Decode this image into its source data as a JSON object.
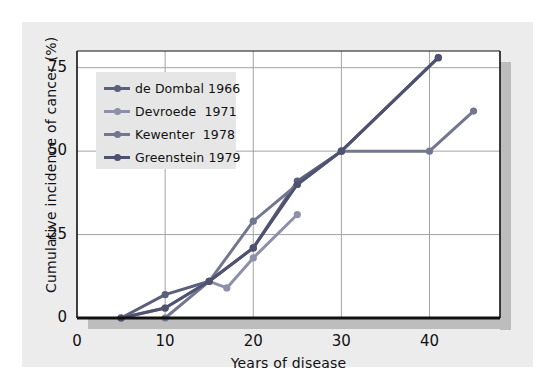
{
  "figure": {
    "background": "#ffffff",
    "panel_color": "#ececed",
    "plot_background": "#ffffff",
    "shadow_color": "#bdbdbd"
  },
  "chart_data": {
    "type": "line",
    "title": "",
    "xlabel": "Years of disease",
    "ylabel": "Cumulative incidence of cancer (%)",
    "xlim": [
      0,
      48
    ],
    "ylim": [
      0,
      80
    ],
    "xticks": [
      0,
      10,
      20,
      30,
      40
    ],
    "xtick_labels": [
      "0",
      "10",
      "20",
      "30",
      "40"
    ],
    "yticks": [
      0,
      25,
      50,
      75
    ],
    "ytick_labels": [
      "0",
      "25",
      "50",
      "75"
    ],
    "grid": true,
    "grid_color": "#9a9a9a",
    "legend_position": "upper left",
    "legend_background": "#e6e6e6",
    "marker": "circle",
    "series": [
      {
        "name": "de Dombal 1966",
        "label": "de Dombal 1966",
        "color": "#5b5f7a",
        "points": [
          {
            "x": 5,
            "y": 0
          },
          {
            "x": 10,
            "y": 7
          },
          {
            "x": 15,
            "y": 11
          },
          {
            "x": 20,
            "y": 21
          },
          {
            "x": 25,
            "y": 41
          },
          {
            "x": 30,
            "y": 50
          },
          {
            "x": 41,
            "y": 78
          }
        ]
      },
      {
        "name": "Devroede 1971",
        "label": "Devroede  1971",
        "color": "#8d90a8",
        "points": [
          {
            "x": 5,
            "y": 0
          },
          {
            "x": 10,
            "y": 3
          },
          {
            "x": 15,
            "y": 11
          },
          {
            "x": 17,
            "y": 9
          },
          {
            "x": 20,
            "y": 18
          },
          {
            "x": 25,
            "y": 31
          }
        ]
      },
      {
        "name": "Kewenter 1978",
        "label": "Kewenter  1978",
        "color": "#73768f",
        "points": [
          {
            "x": 10,
            "y": 0
          },
          {
            "x": 15,
            "y": 11
          },
          {
            "x": 20,
            "y": 29
          },
          {
            "x": 25,
            "y": 40
          },
          {
            "x": 30,
            "y": 50
          },
          {
            "x": 40,
            "y": 50
          },
          {
            "x": 45,
            "y": 62
          }
        ]
      },
      {
        "name": "Greenstein 1979",
        "label": "Greenstein 1979",
        "color": "#4e5270",
        "points": [
          {
            "x": 5,
            "y": 0
          },
          {
            "x": 10,
            "y": 3
          },
          {
            "x": 15,
            "y": 11
          },
          {
            "x": 20,
            "y": 21
          },
          {
            "x": 25,
            "y": 40
          },
          {
            "x": 30,
            "y": 50
          },
          {
            "x": 41,
            "y": 78
          }
        ]
      }
    ]
  }
}
